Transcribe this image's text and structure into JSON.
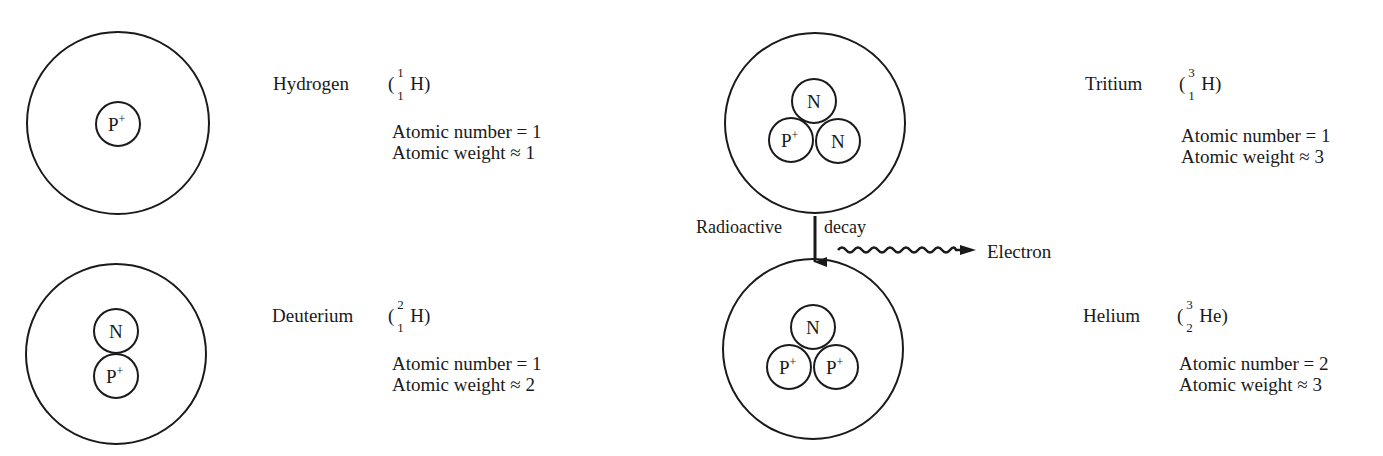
{
  "atoms": [
    {
      "id": "hydrogen",
      "name": "Hydrogen",
      "symbol": "H",
      "mass_number": "1",
      "atomic_number_sub": "1",
      "paren_open": "(",
      "paren_close": ")",
      "atomic_number_line": "Atomic number = 1",
      "atomic_weight_line": "Atomic weight ≈ 1",
      "nucleus": [
        {
          "label": "P",
          "charge": "+"
        }
      ]
    },
    {
      "id": "deuterium",
      "name": "Deuterium",
      "symbol": "H",
      "mass_number": "2",
      "atomic_number_sub": "1",
      "paren_open": "(",
      "paren_close": ")",
      "atomic_number_line": "Atomic number = 1",
      "atomic_weight_line": "Atomic weight ≈ 2",
      "nucleus": [
        {
          "label": "N",
          "charge": ""
        },
        {
          "label": "P",
          "charge": "+"
        }
      ]
    },
    {
      "id": "tritium",
      "name": "Tritium",
      "symbol": "H",
      "mass_number": "3",
      "atomic_number_sub": "1",
      "paren_open": "(",
      "paren_close": ")",
      "atomic_number_line": "Atomic number = 1",
      "atomic_weight_line": "Atomic weight ≈ 3",
      "nucleus": [
        {
          "label": "N",
          "charge": ""
        },
        {
          "label": "P",
          "charge": "+"
        },
        {
          "label": "N",
          "charge": ""
        }
      ]
    },
    {
      "id": "helium",
      "name": "Helium",
      "symbol": "He",
      "mass_number": "3",
      "atomic_number_sub": "2",
      "paren_open": "(",
      "paren_close": ")",
      "atomic_number_line": "Atomic number = 2",
      "atomic_weight_line": "Atomic weight ≈ 3",
      "nucleus": [
        {
          "label": "N",
          "charge": ""
        },
        {
          "label": "P",
          "charge": "+"
        },
        {
          "label": "P",
          "charge": "+"
        }
      ]
    }
  ],
  "decay": {
    "left_label": "Radioactive",
    "right_label": "decay",
    "emitted_particle": "Electron"
  },
  "colors": {
    "stroke": "#1a1a1a",
    "background": "#ffffff"
  }
}
